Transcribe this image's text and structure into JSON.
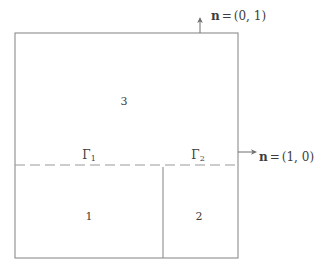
{
  "figure": {
    "background_color": "#ffffff",
    "line_color": "#8c8c8c",
    "text_color": "#3d3d3d",
    "domain": {
      "left": 15,
      "top": 33,
      "right": 238,
      "bottom": 258
    },
    "interface_line": {
      "y": 165,
      "style": "dashed",
      "dash": "10 5",
      "from_x": 15,
      "to_x": 238
    },
    "internal_divider": {
      "x": 163,
      "from_y": 168,
      "to_y": 258,
      "style": "solid"
    },
    "regions": [
      {
        "id": "region-1",
        "label": "1",
        "cx": 89,
        "cy": 216
      },
      {
        "id": "region-2",
        "label": "2",
        "cx": 199,
        "cy": 216
      },
      {
        "id": "region-3",
        "label": "3",
        "cx": 124,
        "cy": 101
      }
    ],
    "boundary_labels": [
      {
        "id": "gamma-1",
        "symbol": "Γ",
        "subscript": "1",
        "x": 89,
        "y": 162
      },
      {
        "id": "gamma-2",
        "symbol": "Γ",
        "subscript": "2",
        "x": 198,
        "y": 162
      }
    ],
    "normals": [
      {
        "id": "normal-top",
        "symbol": "n",
        "equals": "=",
        "value": "(0, 1)",
        "label_x": 211,
        "label_y": 16,
        "arrow": {
          "x1": 200,
          "y1": 33,
          "x2": 200,
          "y2": 19,
          "direction": "up"
        }
      },
      {
        "id": "normal-right",
        "symbol": "n",
        "equals": "=",
        "value": "(1, 0)",
        "label_x": 259,
        "label_y": 157,
        "arrow": {
          "x1": 238,
          "y1": 152,
          "x2": 256,
          "y2": 152,
          "direction": "right"
        }
      }
    ]
  }
}
